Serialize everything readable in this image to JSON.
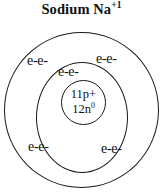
{
  "title": {
    "element_name": "Sodium",
    "symbol": "Na",
    "charge": "+1"
  },
  "nucleus": {
    "protons": "11p+",
    "neutrons_base": "12n",
    "neutrons_charge": "0"
  },
  "shells": {
    "inner": {
      "electrons_top": "e-e-"
    },
    "outer": {
      "electrons_top_left": "e-e-",
      "electrons_top_right": "e-e-",
      "electrons_bottom_left": "e-e-",
      "electrons_bottom_right": "e-e-"
    }
  },
  "colors": {
    "ink": "#111111",
    "orbit_stroke": "#1a1a1a",
    "background": "#ffffff"
  },
  "chart_data": {
    "type": "diagram",
    "diagram_kind": "bohr-atomic-model",
    "title": "Sodium Na+1",
    "element": "Sodium",
    "symbol": "Na",
    "ion_charge": "+1",
    "nucleus": {
      "proton_count": 11,
      "proton_label": "11p+",
      "neutron_count": 12,
      "neutron_label": "12n0"
    },
    "shell_count": 2,
    "shells": [
      {
        "index": 1,
        "name": "inner-shell",
        "electron_labels": [
          "e-e-"
        ],
        "label_positions": [
          "top"
        ]
      },
      {
        "index": 2,
        "name": "outer-shell",
        "electron_labels": [
          "e-e-",
          "e-e-",
          "e-e-",
          "e-e-"
        ],
        "label_positions": [
          "top-left",
          "top-right",
          "bottom-left",
          "bottom-right"
        ]
      }
    ]
  }
}
